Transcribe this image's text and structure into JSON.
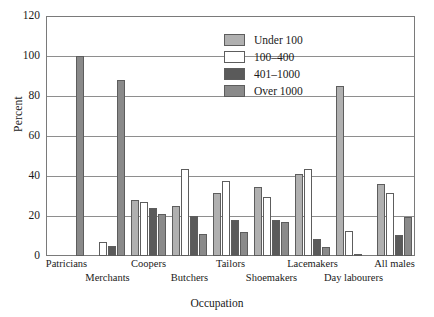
{
  "chart_data": {
    "type": "bar",
    "title": "",
    "subtitle": "",
    "xlabel": "Occupation",
    "ylabel": "Percent",
    "ylim": [
      0,
      120
    ],
    "yticks": [
      0,
      20,
      40,
      60,
      80,
      100,
      120
    ],
    "grid": true,
    "legend_position": "top-center-right",
    "categories": [
      "Patricians",
      "Merchants",
      "Coopers",
      "Butchers",
      "Tailors",
      "Shoemakers",
      "Lacemakers",
      "Day labourers",
      "All males"
    ],
    "series": [
      {
        "name": "Under 100",
        "color": "#b0b0b0",
        "values": [
          0,
          0,
          28,
          25,
          31.5,
          34.5,
          41,
          85,
          36
        ]
      },
      {
        "name": "100–400",
        "color": "#ffffff",
        "values": [
          0,
          7,
          27,
          43.5,
          37.5,
          29.5,
          43.5,
          12.5,
          31.5
        ]
      },
      {
        "name": "401–1000",
        "color": "#5a5a5a",
        "values": [
          0,
          5,
          24,
          20,
          18,
          18,
          8.5,
          0.5,
          10.5
        ]
      },
      {
        "name": "Over 1000",
        "color": "#8a8a8a",
        "values": [
          100,
          88,
          21,
          11,
          12,
          17,
          4.5,
          0,
          19.5
        ]
      }
    ],
    "annotations": []
  },
  "axes": {
    "y_tick_labels": [
      "0",
      "20",
      "40",
      "60",
      "80",
      "100",
      "120"
    ],
    "y_title": "Percent",
    "x_title": "Occupation",
    "x_tick_labels_row1": [
      "Patricians",
      "Coopers",
      "Butchers",
      "Tailors",
      "Lacemakers",
      "All males"
    ],
    "x_tick_labels_row2": [
      "Merchants",
      "Shoemakers",
      "Day labourers"
    ]
  },
  "legend": {
    "items": [
      {
        "label": "Under 100",
        "color": "#b0b0b0"
      },
      {
        "label": "100–400",
        "color": "#ffffff"
      },
      {
        "label": "401–1000",
        "color": "#5a5a5a"
      },
      {
        "label": "Over 1000",
        "color": "#8a8a8a"
      }
    ]
  },
  "style": {
    "axis_color": "#7a7a7a",
    "grid_color": "#8e8e8e",
    "bar_border": "#5d5d5d",
    "background": "#ffffff",
    "text_color": "#1a1a1a"
  }
}
